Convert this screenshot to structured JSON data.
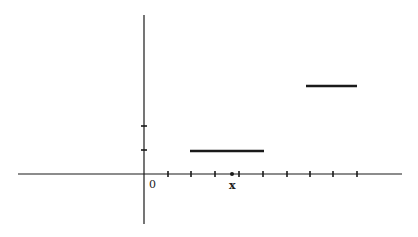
{
  "diagram": {
    "type": "step-function-plot",
    "origin_label": "0",
    "x_label": "x",
    "colors": {
      "ink": "#1a1a1a",
      "background": "#ffffff"
    },
    "axes": {
      "origin_px": [
        144,
        174
      ],
      "x_axis_px": [
        18,
        402
      ],
      "y_axis_px": [
        144,
        15,
        224
      ]
    },
    "x_ticks_px": [
      168,
      191,
      215,
      239,
      263,
      287,
      310,
      333,
      357
    ],
    "x_marker_px": 232,
    "y_ticks_px": [
      150,
      126
    ],
    "segments_px": [
      {
        "x1": 190,
        "x2": 264,
        "y": 151
      },
      {
        "x1": 306,
        "x2": 357,
        "y": 86
      }
    ]
  }
}
